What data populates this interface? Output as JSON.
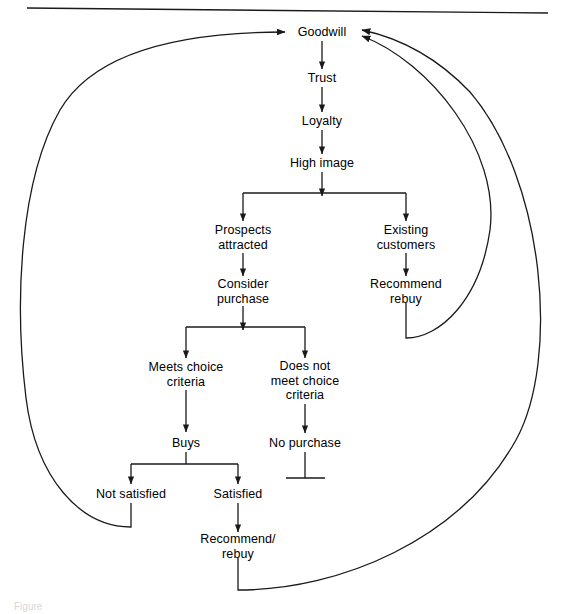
{
  "figure": {
    "caption": "Figure",
    "background_color": "#ffffff",
    "line_color": "#1a1a1a",
    "text_color": "#000000"
  },
  "top_rule": {
    "name": "horizontal-rule",
    "x1": 27,
    "y1": 8,
    "x2": 548,
    "y2": 13
  },
  "nodes": [
    {
      "id": "goodwill",
      "label": "Goodwill",
      "x": 322,
      "y": 32
    },
    {
      "id": "trust",
      "label": "Trust",
      "x": 322,
      "y": 78
    },
    {
      "id": "loyalty",
      "label": "Loyalty",
      "x": 322,
      "y": 121
    },
    {
      "id": "high-image",
      "label": "High image",
      "x": 322,
      "y": 163
    },
    {
      "id": "prospects",
      "label": "Prospects\nattracted",
      "x": 243,
      "y": 237
    },
    {
      "id": "existing",
      "label": "Existing\ncustomers",
      "x": 406,
      "y": 237
    },
    {
      "id": "consider",
      "label": "Consider\npurchase",
      "x": 243,
      "y": 291
    },
    {
      "id": "recommend-rebuy",
      "label": "Recommend\nrebuy",
      "x": 406,
      "y": 291
    },
    {
      "id": "meets",
      "label": "Meets choice\ncriteria",
      "x": 186,
      "y": 374
    },
    {
      "id": "does-not-meet",
      "label": "Does not\nmeet choice\ncriteria",
      "x": 305,
      "y": 381
    },
    {
      "id": "buys",
      "label": "Buys",
      "x": 186,
      "y": 443
    },
    {
      "id": "no-purchase",
      "label": "No purchase",
      "x": 305,
      "y": 443
    },
    {
      "id": "not-satisfied",
      "label": "Not satisfied",
      "x": 131,
      "y": 494
    },
    {
      "id": "satisfied",
      "label": "Satisfied",
      "x": 238,
      "y": 494
    },
    {
      "id": "recommend-slash",
      "label": "Recommend/\nrebuy",
      "x": 238,
      "y": 546
    }
  ],
  "straight_edges": [
    {
      "name": "edge-goodwill-trust",
      "x1": 322,
      "y1": 41,
      "x2": 322,
      "y2": 69,
      "arrow": true
    },
    {
      "name": "edge-trust-loyalty",
      "x1": 322,
      "y1": 87,
      "x2": 322,
      "y2": 112,
      "arrow": true
    },
    {
      "name": "edge-loyalty-highimage",
      "x1": 322,
      "y1": 130,
      "x2": 322,
      "y2": 154,
      "arrow": true
    },
    {
      "name": "edge-highimage-split-stem",
      "x1": 322,
      "y1": 172,
      "x2": 322,
      "y2": 196,
      "arrow": true
    },
    {
      "name": "edge-split-bar-highimage",
      "x1": 243,
      "y1": 193,
      "x2": 406,
      "y2": 193,
      "arrow": false
    },
    {
      "name": "edge-split-left-prospects",
      "x1": 243,
      "y1": 193,
      "x2": 243,
      "y2": 221,
      "arrow": true
    },
    {
      "name": "edge-split-right-existing",
      "x1": 406,
      "y1": 193,
      "x2": 406,
      "y2": 221,
      "arrow": true
    },
    {
      "name": "edge-prospects-consider",
      "x1": 243,
      "y1": 253,
      "x2": 243,
      "y2": 276,
      "arrow": true
    },
    {
      "name": "edge-existing-recommend",
      "x1": 406,
      "y1": 253,
      "x2": 406,
      "y2": 276,
      "arrow": true
    },
    {
      "name": "edge-consider-split-stem",
      "x1": 243,
      "y1": 306,
      "x2": 243,
      "y2": 330,
      "arrow": true
    },
    {
      "name": "edge-split-bar-consider",
      "x1": 186,
      "y1": 327,
      "x2": 305,
      "y2": 327,
      "arrow": false
    },
    {
      "name": "edge-split-left-meets",
      "x1": 186,
      "y1": 327,
      "x2": 186,
      "y2": 358,
      "arrow": true
    },
    {
      "name": "edge-split-right-doesnotmeet",
      "x1": 305,
      "y1": 327,
      "x2": 305,
      "y2": 358,
      "arrow": true
    },
    {
      "name": "edge-meets-buys",
      "x1": 186,
      "y1": 390,
      "x2": 186,
      "y2": 432,
      "arrow": true
    },
    {
      "name": "edge-doesnotmeet-nopurchase",
      "x1": 305,
      "y1": 404,
      "x2": 305,
      "y2": 433,
      "arrow": true
    },
    {
      "name": "edge-buys-split-stem",
      "x1": 186,
      "y1": 452,
      "x2": 186,
      "y2": 464,
      "arrow": false
    },
    {
      "name": "edge-split-bar-buys",
      "x1": 131,
      "y1": 464,
      "x2": 238,
      "y2": 464,
      "arrow": false
    },
    {
      "name": "edge-split-left-notsatisfied",
      "x1": 131,
      "y1": 464,
      "x2": 131,
      "y2": 484,
      "arrow": true
    },
    {
      "name": "edge-split-right-satisfied",
      "x1": 238,
      "y1": 464,
      "x2": 238,
      "y2": 484,
      "arrow": true
    },
    {
      "name": "edge-satisfied-recommend",
      "x1": 238,
      "y1": 503,
      "x2": 238,
      "y2": 532,
      "arrow": true
    },
    {
      "name": "edge-nopurchase-terminal-stem",
      "x1": 305,
      "y1": 452,
      "x2": 305,
      "y2": 478,
      "arrow": false
    },
    {
      "name": "edge-nopurchase-terminal-bar",
      "x1": 286,
      "y1": 478,
      "x2": 325,
      "y2": 478,
      "arrow": false
    }
  ],
  "feedback_loops": [
    {
      "name": "loop-not-satisfied-to-goodwill",
      "from": "not-satisfied",
      "to": "goodwill",
      "path": "M131,503 L131,527 C80,527 36,478 26,398 C14,300 20,180 60,110 C95,50 185,32 285,32"
    },
    {
      "name": "loop-recommend-rebuy-to-goodwill",
      "from": "recommend-rebuy",
      "to": "goodwill",
      "path": "M406,303 L406,338 C440,338 480,300 490,230 C500,150 430,62 362,36"
    },
    {
      "name": "loop-recommend-slash-rebuy-to-goodwill",
      "from": "recommend-slash",
      "to": "goodwill",
      "path": "M238,558 L238,590 C340,590 460,540 516,440 C560,360 545,180 470,92 C430,50 390,36 362,30"
    }
  ]
}
